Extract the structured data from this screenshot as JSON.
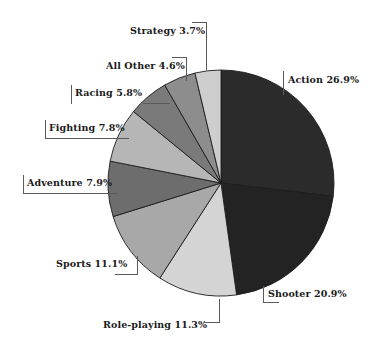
{
  "chart_data": {
    "type": "pie",
    "title": "",
    "subtitle": "",
    "xlabel": "",
    "ylabel": "",
    "legend_position": "none",
    "grid": false,
    "units": "percent",
    "start_angle_deg": 0,
    "direction": "clockwise",
    "categories": [
      "Action",
      "Shooter",
      "Role-playing",
      "Sports",
      "Adventure",
      "Fighting",
      "Racing",
      "All Other",
      "Strategy"
    ],
    "values": [
      26.9,
      20.9,
      11.3,
      11.1,
      7.9,
      7.8,
      5.8,
      4.6,
      3.7
    ],
    "slices": [
      {
        "label": "Action",
        "value": 26.9,
        "text": "Action 26.9%",
        "color": "#2b2b2b"
      },
      {
        "label": "Shooter",
        "value": 20.9,
        "text": "Shooter 20.9%",
        "color": "#232323"
      },
      {
        "label": "Role-playing",
        "value": 11.3,
        "text": "Role-playing 11.3%",
        "color": "#d4d4d4"
      },
      {
        "label": "Sports",
        "value": 11.1,
        "text": "Sports 11.1%",
        "color": "#a8a8a8"
      },
      {
        "label": "Adventure",
        "value": 7.9,
        "text": "Adventure 7.9%",
        "color": "#6d6d6d"
      },
      {
        "label": "Fighting",
        "value": 7.8,
        "text": "Fighting 7.8%",
        "color": "#b6b6b6"
      },
      {
        "label": "Racing",
        "value": 5.8,
        "text": "Racing 5.8%",
        "color": "#7a7a7a"
      },
      {
        "label": "All Other",
        "value": 4.6,
        "text": "All Other 4.6%",
        "color": "#8d8d8d"
      },
      {
        "label": "Strategy",
        "value": 3.7,
        "text": "Strategy 3.7%",
        "color": "#cecece"
      }
    ]
  },
  "labels": {
    "action": "Action 26.9%",
    "shooter": "Shooter 20.9%",
    "role_playing": "Role-playing 11.3%",
    "sports": "Sports 11.1%",
    "adventure": "Adventure 7.9%",
    "fighting": "Fighting 7.8%",
    "racing": "Racing 5.8%",
    "all_other": "All Other 4.6%",
    "strategy": "Strategy 3.7%"
  },
  "geometry": {
    "center_x": 221,
    "center_y": 183,
    "radius": 113
  }
}
